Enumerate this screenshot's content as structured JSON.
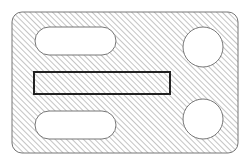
{
  "diagram": {
    "type": "hatched-section-plate",
    "colors": {
      "background": "#ffffff",
      "hatch": "#8a8a8a",
      "outline": "#777777",
      "highlight": "#222222"
    },
    "plate": {
      "x": 12,
      "y": 12,
      "width": 226,
      "height": 141,
      "corner_radius": 10
    },
    "slots": [
      {
        "x": 35,
        "y": 27,
        "width": 81,
        "height": 28
      },
      {
        "x": 35,
        "y": 111,
        "width": 81,
        "height": 28
      }
    ],
    "holes": [
      {
        "cx": 203,
        "cy": 47,
        "r": 20
      },
      {
        "cx": 203,
        "cy": 119,
        "r": 20
      }
    ],
    "highlight_rect": {
      "x": 34,
      "y": 72,
      "width": 136,
      "height": 22
    }
  }
}
